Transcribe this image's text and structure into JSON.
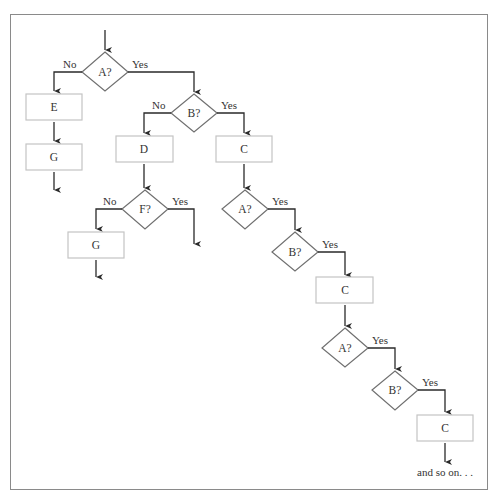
{
  "diagram": {
    "type": "flowchart",
    "nodes": {
      "a1": {
        "label": "A?",
        "shape": "diamond"
      },
      "e": {
        "label": "E",
        "shape": "box"
      },
      "g1": {
        "label": "G",
        "shape": "box"
      },
      "b1": {
        "label": "B?",
        "shape": "diamond"
      },
      "d": {
        "label": "D",
        "shape": "box"
      },
      "c1": {
        "label": "C",
        "shape": "box"
      },
      "f": {
        "label": "F?",
        "shape": "diamond"
      },
      "g2": {
        "label": "G",
        "shape": "box"
      },
      "a2": {
        "label": "A?",
        "shape": "diamond"
      },
      "b2": {
        "label": "B?",
        "shape": "diamond"
      },
      "c2": {
        "label": "C",
        "shape": "box"
      },
      "a3": {
        "label": "A?",
        "shape": "diamond"
      },
      "b3": {
        "label": "B?",
        "shape": "diamond"
      },
      "c3": {
        "label": "C",
        "shape": "box"
      }
    },
    "edges": {
      "a1_no": "No",
      "a1_yes": "Yes",
      "b1_no": "No",
      "b1_yes": "Yes",
      "f_no": "No",
      "f_yes": "Yes",
      "a2_yes": "Yes",
      "b2_yes": "Yes",
      "a3_yes": "Yes",
      "b3_yes": "Yes"
    },
    "footer_text": "and so on. . ."
  }
}
